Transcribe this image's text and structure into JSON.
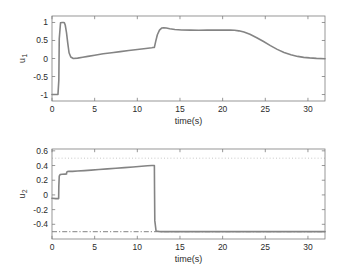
{
  "figure": {
    "background": "#ffffff",
    "line_color": "#848484",
    "axis_color": "#7d7d7d",
    "text_color": "#2b2b2b",
    "reference_color": "#9a9a9a"
  },
  "chart_data": [
    {
      "type": "line",
      "panel": "top",
      "title": "",
      "xlabel": "time(s)",
      "ylabel": "u",
      "ylabel_subscript": "1",
      "xlim": [
        0,
        32
      ],
      "ylim": [
        -1.18,
        1.18
      ],
      "xticks": [
        0,
        5,
        10,
        15,
        20,
        25,
        30
      ],
      "xticklabels": [
        "0",
        "5",
        "10",
        "15",
        "20",
        "25",
        "30"
      ],
      "yticks": [
        -1,
        -0.5,
        0,
        0.5,
        1
      ],
      "yticklabels": [
        "-1",
        "-0.5",
        "0",
        "0.5",
        "1"
      ],
      "grid": false,
      "legend": null,
      "series": [
        {
          "name": "u1",
          "style": "solid",
          "color": "#848484",
          "x": [
            0.0,
            0.7,
            0.8,
            0.85,
            1.0,
            1.2,
            1.35,
            1.45,
            1.55,
            1.7,
            1.85,
            2.0,
            2.2,
            2.5,
            3.0,
            3.6,
            4.2,
            5.0,
            6.0,
            7.0,
            8.0,
            9.0,
            10.0,
            11.0,
            11.7,
            11.95,
            12.0,
            12.15,
            12.35,
            12.6,
            12.85,
            13.1,
            13.4,
            13.8,
            14.4,
            15.2,
            16.2,
            17.2,
            18.2,
            19.2,
            20.2,
            20.9,
            21.4,
            21.9,
            22.5,
            23.2,
            24.0,
            24.8,
            25.6,
            26.4,
            27.2,
            28.0,
            28.8,
            29.5,
            30.2,
            31.0,
            32.0
          ],
          "y": [
            -1.0,
            -1.0,
            -0.6,
            0.55,
            0.99,
            1.0,
            1.0,
            0.99,
            0.93,
            0.72,
            0.42,
            0.16,
            0.04,
            0.0,
            0.01,
            0.035,
            0.06,
            0.09,
            0.13,
            0.16,
            0.19,
            0.22,
            0.25,
            0.28,
            0.3,
            0.31,
            0.31,
            0.47,
            0.66,
            0.79,
            0.845,
            0.855,
            0.845,
            0.825,
            0.805,
            0.793,
            0.787,
            0.786,
            0.787,
            0.788,
            0.789,
            0.789,
            0.783,
            0.768,
            0.735,
            0.672,
            0.578,
            0.47,
            0.357,
            0.253,
            0.167,
            0.103,
            0.058,
            0.032,
            0.016,
            0.004,
            -0.005
          ]
        }
      ],
      "reference_lines": []
    },
    {
      "type": "line",
      "panel": "bottom",
      "title": "",
      "xlabel": "time(s)",
      "ylabel": "u",
      "ylabel_subscript": "2",
      "xlim": [
        0,
        32
      ],
      "ylim": [
        -0.6,
        0.625
      ],
      "xticks": [
        0,
        5,
        10,
        15,
        20,
        25,
        30
      ],
      "xticklabels": [
        "0",
        "5",
        "10",
        "15",
        "20",
        "25",
        "30"
      ],
      "yticks": [
        -0.4,
        -0.2,
        0,
        0.2,
        0.4,
        0.6
      ],
      "yticklabels": [
        "-0.4",
        "-0.2",
        "0",
        "0.2",
        "0.4",
        "0.6"
      ],
      "grid": false,
      "legend": null,
      "series": [
        {
          "name": "u2",
          "style": "solid",
          "color": "#848484",
          "x": [
            0.0,
            0.45,
            0.78,
            0.8,
            0.85,
            0.95,
            1.2,
            1.55,
            1.7,
            1.72,
            1.8,
            2.0,
            2.4,
            3.0,
            3.8,
            4.6,
            5.5,
            6.5,
            7.5,
            8.5,
            9.5,
            10.5,
            11.2,
            11.7,
            11.9,
            11.95,
            12.0,
            12.02,
            12.05,
            12.2,
            12.6,
            13.5,
            15.0,
            17.0,
            19.0,
            21.0,
            23.0,
            25.0,
            27.0,
            29.0,
            31.0,
            32.0
          ],
          "y": [
            -0.045,
            -0.05,
            -0.05,
            0.12,
            0.255,
            0.277,
            0.281,
            0.283,
            0.284,
            0.305,
            0.318,
            0.32,
            0.321,
            0.325,
            0.331,
            0.338,
            0.346,
            0.355,
            0.363,
            0.372,
            0.381,
            0.39,
            0.396,
            0.4,
            0.401,
            0.401,
            0.401,
            0.05,
            -0.35,
            -0.492,
            -0.499,
            -0.5,
            -0.5,
            -0.5,
            -0.5,
            -0.5,
            -0.5,
            -0.5,
            -0.5,
            -0.5,
            -0.5,
            -0.5
          ]
        }
      ],
      "reference_lines": [
        {
          "name": "upper-limit",
          "value": 0.5,
          "style": "dotted",
          "color": "#b9b9b9"
        },
        {
          "name": "lower-limit",
          "value": -0.5,
          "style": "dashdot",
          "color": "#9a9a9a"
        }
      ]
    }
  ]
}
